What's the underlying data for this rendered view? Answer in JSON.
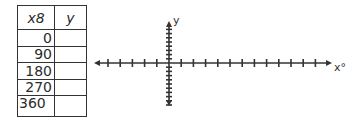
{
  "table": {
    "headers": {
      "x": "x8",
      "y": "y"
    },
    "rows": [
      {
        "x": "0",
        "y": ""
      },
      {
        "x": "90",
        "y": ""
      },
      {
        "x": "180",
        "y": ""
      },
      {
        "x": "270",
        "y": ""
      },
      {
        "x": "360",
        "y": ""
      }
    ]
  },
  "graph": {
    "x_axis_label": "x°",
    "y_axis_label": "y",
    "x_ticks_negative": 5,
    "x_ticks_positive": 12,
    "y_ticks_positive": 8,
    "y_ticks_negative": 10,
    "axis_color": "#333333"
  }
}
